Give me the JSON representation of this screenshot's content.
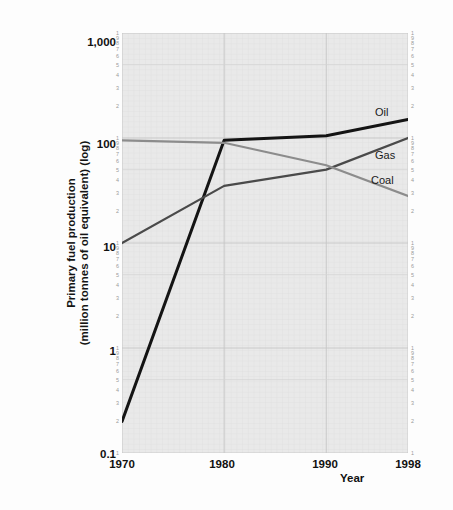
{
  "chart_data": {
    "type": "line",
    "title": "",
    "xlabel": "Year",
    "ylabel_line1": "Primary fuel production",
    "ylabel_line2": "(million tonnes of oil equivalent) (log)",
    "x": [
      1970,
      1980,
      1990,
      1998
    ],
    "xlim": [
      1970,
      1998
    ],
    "ylim": [
      0.1,
      1000
    ],
    "yscale": "log",
    "grid": true,
    "legend_position": "inline-right",
    "xticks": [
      "1970",
      "1980",
      "1990",
      "1998"
    ],
    "yticks": [
      "1,000",
      "100",
      "10",
      "1",
      "0.1"
    ],
    "minor_tick_labels": [
      "9",
      "8",
      "7",
      "6",
      "5",
      "4",
      "3",
      "2"
    ],
    "series": [
      {
        "name": "Oil",
        "color": "#141414",
        "values": [
          0.2,
          95,
          105,
          150
        ]
      },
      {
        "name": "Gas",
        "color": "#4a4a4a",
        "values": [
          10,
          35,
          50,
          100
        ]
      },
      {
        "name": "Coal",
        "color": "#8c8c8c",
        "values": [
          95,
          90,
          55,
          28
        ]
      }
    ]
  },
  "axes": {
    "y_major_labels": [
      {
        "text": "1,000",
        "value": 1000
      },
      {
        "text": "100",
        "value": 100
      },
      {
        "text": "10",
        "value": 10
      },
      {
        "text": "1",
        "value": 1
      },
      {
        "text": "0.1",
        "value": 0.1
      }
    ],
    "x_major_labels": [
      {
        "text": "1970",
        "value": 1970
      },
      {
        "text": "1980",
        "value": 1980
      },
      {
        "text": "1990",
        "value": 1990
      },
      {
        "text": "1998",
        "value": 1998
      }
    ],
    "x_axis_title": "Year"
  },
  "series_labels": {
    "oil": "Oil",
    "gas": "Gas",
    "coal": "Coal"
  },
  "colors": {
    "plot_background": "#e9e9e9",
    "grid_minor": "#dddddd",
    "grid_major": "#cfcfcf",
    "oil": "#141414",
    "gas": "#4a4a4a",
    "coal": "#8c8c8c",
    "text": "#111111",
    "minor_tick_text": "#9a9a9a"
  }
}
